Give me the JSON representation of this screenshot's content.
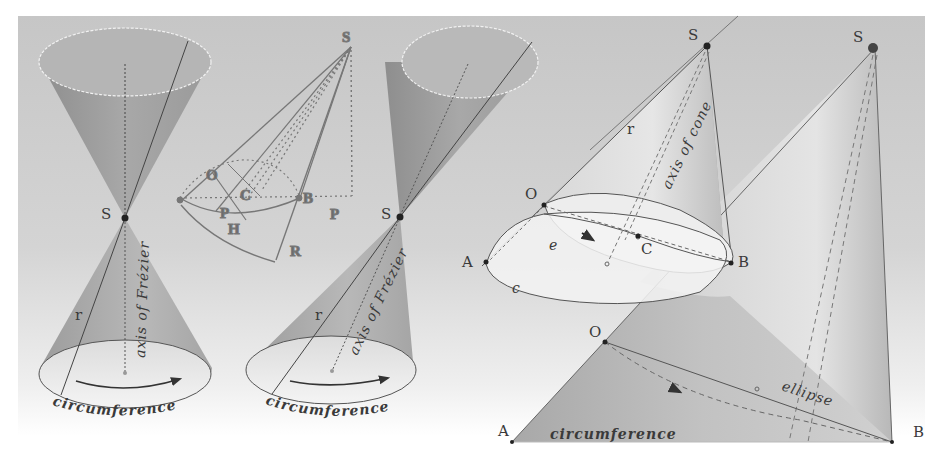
{
  "figure": {
    "background_color": "#c9c9c9",
    "panels": [
      {
        "id": "double-cone",
        "apex_label": "S",
        "generator_label": "r",
        "axis_label": "axis of Frézier",
        "base_label": "circumference"
      },
      {
        "id": "frezier-engraving",
        "apex_label": "S",
        "labels": [
          "O",
          "C",
          "B",
          "P",
          "H",
          "R",
          "P"
        ]
      },
      {
        "id": "oblique-double-cone",
        "apex_label": "S",
        "generator_label": "r",
        "axis_label": "axis of Frézier",
        "base_label": "circumference"
      },
      {
        "id": "oblique-cone-sections",
        "apex_label": "S",
        "generator_label": "r",
        "axis_label": "axis of cone",
        "points": [
          "O",
          "A",
          "C",
          "B"
        ],
        "curve_labels": [
          "e",
          "c"
        ]
      },
      {
        "id": "developed-cone",
        "apex_label": "S",
        "points": [
          "O",
          "A",
          "B"
        ],
        "curve_labels": [
          "ellipse",
          "circumference"
        ]
      }
    ]
  }
}
